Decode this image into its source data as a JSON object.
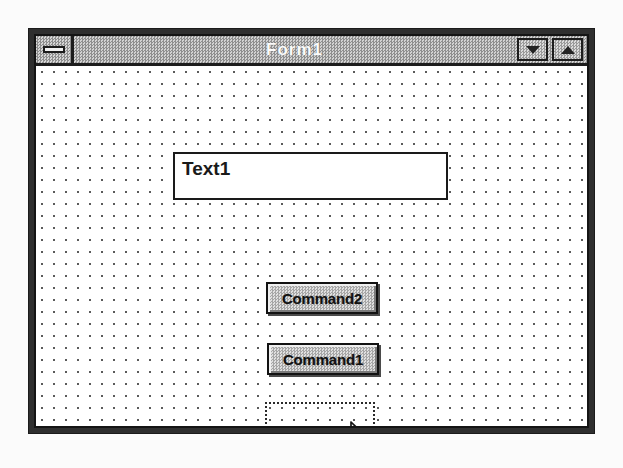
{
  "window": {
    "title": "Form1",
    "system_menu_icon": "control-menu-box-icon",
    "buttons": [
      {
        "name": "minimize",
        "icon": "triangle-down-icon"
      },
      {
        "name": "maximize",
        "icon": "triangle-up-icon"
      }
    ]
  },
  "canvas": {
    "grid_spacing_px": 12,
    "grid_dot_color": "#5a5a5a",
    "background_color": "#ffffff"
  },
  "controls": [
    {
      "type": "textbox",
      "name": "Text1",
      "value": "Text1",
      "x": 137,
      "y": 86,
      "width": 275,
      "height": 48
    },
    {
      "type": "commandbutton",
      "name": "Command2",
      "caption": "Command2",
      "x": 230,
      "y": 216,
      "width": 112,
      "height": 32
    },
    {
      "type": "commandbutton",
      "name": "Command1",
      "caption": "Command1",
      "x": 231,
      "y": 277,
      "width": 112,
      "height": 32
    }
  ],
  "selection_rectangle": {
    "label": "rubber-band-selection",
    "x": 229,
    "y": 336,
    "width": 110,
    "height": 34,
    "style": "dotted"
  },
  "cursor": {
    "type": "arrow-pointer",
    "x": 313,
    "y": 355
  },
  "colors": {
    "titlebar": "#a9a9a9",
    "title_text": "#fbfbfb",
    "button_face": "#c3c3c3",
    "border": "#141414",
    "page_background": "#fbfbfb"
  }
}
